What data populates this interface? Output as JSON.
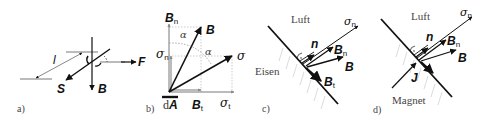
{
  "panels": [
    {
      "id": "a",
      "caption": "a)",
      "labels": {
        "length": "l",
        "force": "F",
        "wire_direction": "S",
        "field": "B"
      }
    },
    {
      "id": "b",
      "caption": "b)",
      "labels": {
        "field_normal": "B",
        "field_normal_sub": "n",
        "field": "B",
        "stress_normal": "σ",
        "stress_normal_sub": "n",
        "stress": "σ",
        "angle_1": "α",
        "angle_2": "α",
        "area_element": "d",
        "area_element_vec": "A",
        "field_tangential": "B",
        "field_tangential_sub": "t",
        "stress_tangential": "σ",
        "stress_tangential_sub": "t"
      }
    },
    {
      "id": "c",
      "caption": "c)",
      "labels": {
        "upper_medium": "Luft",
        "lower_medium": "Eisen",
        "stress_normal": "σ",
        "stress_normal_sub": "n",
        "normal": "n",
        "field_normal": "B",
        "field_normal_sub": "n",
        "field": "B",
        "field_tangential": "B",
        "field_tangential_sub": "t"
      }
    },
    {
      "id": "d",
      "caption": "d)",
      "labels": {
        "upper_medium": "Luft",
        "lower_medium": "Magnet",
        "stress_normal": "σ",
        "stress_normal_sub": "n",
        "normal": "n",
        "field_normal": "B",
        "field_normal_sub": "n",
        "field": "B",
        "current_density": "J"
      }
    }
  ],
  "colors": {
    "ink": "#111111",
    "guide": "#9a9a9a",
    "hatch": "#c8c8c8",
    "caption": "#444444"
  }
}
